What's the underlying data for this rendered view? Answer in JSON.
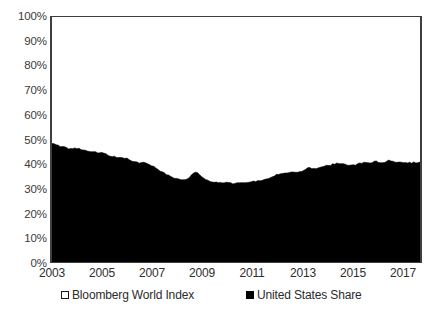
{
  "chart_data": {
    "type": "area",
    "title": "",
    "subtitle": "",
    "xlabel": "",
    "ylabel": "",
    "xlim": [
      2003,
      2017.75
    ],
    "ylim": [
      0,
      100
    ],
    "grid": false,
    "legend_position": "bottom",
    "y_ticks": [
      "100%",
      "90%",
      "80%",
      "70%",
      "60%",
      "50%",
      "40%",
      "30%",
      "20%",
      "10%",
      "0%"
    ],
    "y_tick_values": [
      100,
      90,
      80,
      70,
      60,
      50,
      40,
      30,
      20,
      10,
      0
    ],
    "x_ticks": [
      "2003",
      "2005",
      "2007",
      "2009",
      "2011",
      "2013",
      "2015",
      "2017"
    ],
    "x_tick_values": [
      2003,
      2005,
      2007,
      2009,
      2011,
      2013,
      2015,
      2017
    ],
    "legend": [
      {
        "label": "Bloomberg World Index",
        "marker": "hollow-square",
        "color": "#ffffff"
      },
      {
        "label": "United States Share",
        "marker": "filled-square",
        "color": "#000000"
      }
    ],
    "series": [
      {
        "name": "United States Share",
        "color": "#000000",
        "fill": "#000000",
        "x": [
          2003.0,
          2003.25,
          2003.5,
          2003.75,
          2004.0,
          2004.25,
          2004.5,
          2004.75,
          2005.0,
          2005.25,
          2005.5,
          2005.75,
          2006.0,
          2006.25,
          2006.5,
          2006.75,
          2007.0,
          2007.25,
          2007.5,
          2007.75,
          2008.0,
          2008.25,
          2008.5,
          2008.75,
          2009.0,
          2009.25,
          2009.5,
          2009.75,
          2010.0,
          2010.25,
          2010.5,
          2010.75,
          2011.0,
          2011.25,
          2011.5,
          2011.75,
          2012.0,
          2012.25,
          2012.5,
          2012.75,
          2013.0,
          2013.25,
          2013.5,
          2013.75,
          2014.0,
          2014.25,
          2014.5,
          2014.75,
          2015.0,
          2015.25,
          2015.5,
          2015.75,
          2016.0,
          2016.25,
          2016.5,
          2016.75,
          2017.0,
          2017.25,
          2017.5,
          2017.75
        ],
        "values": [
          48.5,
          47.6,
          46.9,
          46.2,
          46.4,
          45.6,
          45.3,
          44.8,
          44.6,
          43.6,
          43.0,
          42.6,
          42.2,
          41.2,
          40.4,
          40.6,
          39.4,
          37.6,
          36.2,
          35.0,
          34.0,
          33.4,
          34.6,
          36.6,
          35.0,
          33.4,
          32.6,
          32.4,
          32.6,
          32.0,
          32.4,
          32.4,
          32.8,
          33.0,
          33.6,
          34.6,
          35.6,
          36.2,
          36.6,
          36.4,
          37.0,
          38.4,
          38.2,
          38.4,
          39.2,
          39.8,
          40.4,
          39.8,
          39.4,
          40.0,
          40.6,
          40.4,
          41.0,
          40.4,
          41.4,
          40.6,
          40.8,
          40.4,
          40.6,
          40.8
        ],
        "start_value": 48.5,
        "min_value": 31.8,
        "min_year": 2010,
        "max_value": 48.5,
        "max_year": 2003,
        "end_value": 40.8
      }
    ]
  }
}
